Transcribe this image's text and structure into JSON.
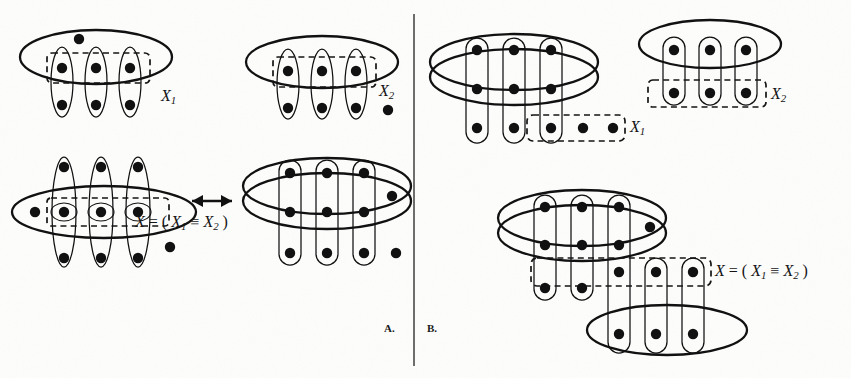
{
  "figure": {
    "panels": [
      {
        "id": "A",
        "letter": "A."
      },
      {
        "id": "B",
        "letter": "B."
      }
    ],
    "colors": {
      "ink": "#111111",
      "paper": "#fdfdfc",
      "dashed": "#151515",
      "divider": "#4a4a4a"
    },
    "divider": {
      "name": "panel-divider",
      "x": 414,
      "y1": 14,
      "y2": 366
    }
  },
  "labels": {
    "a_x1": {
      "text": "X",
      "sub": "1"
    },
    "a_x2": {
      "text": "X",
      "sub": "2"
    },
    "a_x_equiv_prefix": "X",
    "a_x_equiv_body": " = ( X",
    "b_x1": {
      "text": "X",
      "sub": "1"
    },
    "b_x2": {
      "text": "X",
      "sub": "2"
    },
    "equation": {
      "var": "X",
      "eq": " = ( ",
      "left": "X",
      "left_sub": "1",
      "op": " ≡ ",
      "right": "X",
      "right_sub": "2",
      "close": " )"
    },
    "arrow": "↔"
  },
  "diagrams": {
    "a_top_left": {
      "name": "partition-x1-top-left",
      "outer_shape": "ellipse",
      "dots_in_ellipse": 4,
      "free_dots": 0,
      "columns": 3,
      "dots_per_column": 2,
      "dashed_box_label": "X1"
    },
    "a_top_right": {
      "name": "partition-x2-top-right",
      "outer_shape": "ellipse",
      "dots_in_ellipse": 3,
      "free_dots": 1,
      "columns": 3,
      "dots_per_column": 2,
      "dashed_box_label": "X2"
    },
    "a_bottom_left": {
      "name": "partition-join-bottom-left",
      "outer_shape": "flat-ellipse",
      "dots_in_ellipse": 4,
      "free_dots": 1,
      "columns": 3,
      "dots_per_column": 3,
      "dashed_box_label": "X"
    },
    "a_bottom_right": {
      "name": "partition-band-bottom-right",
      "outer_shape": "band-ellipse",
      "rows": 3,
      "columns": 3,
      "free_dots": 2
    },
    "b_top_left": {
      "name": "partition-x1-band-top-left",
      "outer_shape": "band-ellipse",
      "rows": 3,
      "columns": 3,
      "free_dots": 2,
      "dashed_box_label": "X1"
    },
    "b_top_right": {
      "name": "partition-x2-top-right",
      "outer_shape": "ellipse",
      "rows": 2,
      "columns": 3,
      "dashed_box_label": "X2"
    },
    "b_bottom": {
      "name": "partition-meet-bottom",
      "outer_shape": "band-ellipse",
      "rows": 3,
      "columns": 3,
      "free_dots": 1,
      "lower_ellipse": true,
      "dashed_box_label": "X"
    }
  }
}
